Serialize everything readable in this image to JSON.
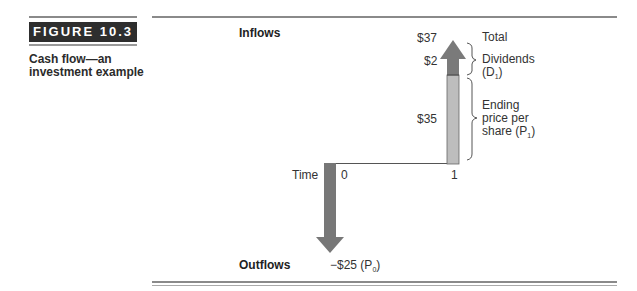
{
  "figure": {
    "label": "FIGURE 10.3",
    "caption": "Cash flow—an investment example"
  },
  "diagram": {
    "inflows_label": "Inflows",
    "outflows_label": "Outflows",
    "time_label": "Time",
    "time_points": [
      "0",
      "1"
    ],
    "inflow_values": {
      "total": "$37",
      "dividends": "$2",
      "ending_price": "$35"
    },
    "outflow_value": "−$25 (P",
    "outflow_sub": "0",
    "right_labels": {
      "total": "Total",
      "dividends": "Dividends",
      "dividends_symbol": "(D",
      "dividends_sub": "1",
      "ending_price_line1": "Ending",
      "ending_price_line2": "price per",
      "ending_price_line3": "share (P",
      "ending_price_sub": "1"
    },
    "colors": {
      "dark_segment": "#7a7a7a",
      "light_segment": "#bdbdbd",
      "outflow_arrow": "#777777",
      "lines": "#555555"
    }
  }
}
